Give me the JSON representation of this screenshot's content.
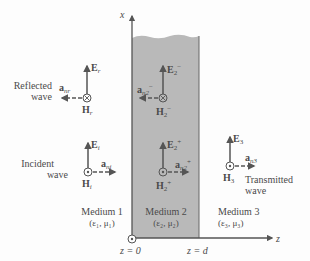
{
  "diagram": {
    "type": "electromagnetic-wave-three-media",
    "colors": {
      "medium2_fill": "#b9b9b9",
      "line": "#555555",
      "text": "#4a4a4a",
      "background": "#fdfdfd"
    },
    "axes": {
      "x_label": "x",
      "z_label": "z",
      "z0_label": "z = 0",
      "zd_label": "z = d"
    },
    "media": [
      {
        "name": "Medium 1",
        "params": "(ε₁, μ₁)"
      },
      {
        "name": "Medium 2",
        "params": "(ε₂, μ₂)"
      },
      {
        "name": "Medium 3",
        "params": "(ε₃, μ₃)"
      }
    ],
    "waves": {
      "reflected": {
        "label_line1": "Reflected",
        "label_line2": "wave",
        "E": "E",
        "E_sub": "r",
        "H": "H",
        "H_sub": "r",
        "a": "a",
        "a_sub": "nr",
        "H_symbol": "⊗"
      },
      "incident": {
        "label_line1": "Incident",
        "label_line2": "wave",
        "E": "E",
        "E_sub": "i",
        "H": "H",
        "H_sub": "i",
        "a": "a",
        "a_sub": "ni",
        "H_symbol": "⊙"
      },
      "medium2_backward": {
        "E": "E",
        "E_sub": "2",
        "E_sup": "−",
        "H": "H",
        "H_sub": "2",
        "H_sup": "−",
        "a": "a",
        "a_sub": "n2",
        "a_sup": "−",
        "H_symbol": "⊗"
      },
      "medium2_forward": {
        "E": "E",
        "E_sub": "2",
        "E_sup": "+",
        "H": "H",
        "H_sub": "2",
        "H_sup": "+",
        "a": "a",
        "a_sub": "n2",
        "a_sup": "+",
        "H_symbol": "⊙"
      },
      "transmitted": {
        "label_line1": "Transmitted",
        "label_line2": "wave",
        "E": "E",
        "E_sub": "3",
        "H": "H",
        "H_sub": "3",
        "a": "a",
        "a_sub": "n3",
        "H_symbol": "⊙"
      }
    }
  }
}
